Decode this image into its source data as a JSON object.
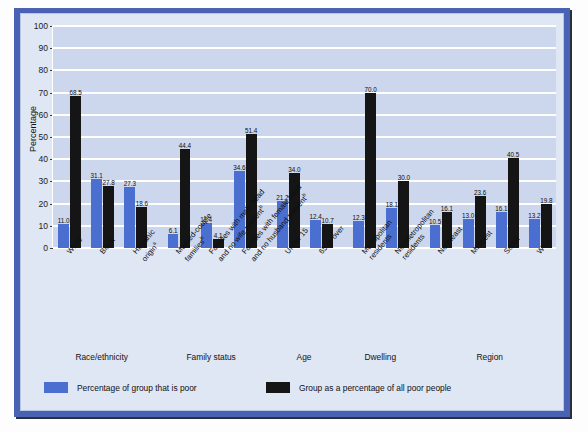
{
  "chart_data": {
    "type": "bar",
    "title": "",
    "xlabel": "",
    "ylabel": "Percentage",
    "ylim": [
      0,
      100
    ],
    "yticks": [
      0,
      10,
      20,
      30,
      40,
      50,
      60,
      70,
      80,
      90,
      100
    ],
    "grid": true,
    "legend_position": "bottom-left",
    "categories": [
      "White",
      "Black",
      "Hispanic originᵃ",
      "Married-couple familiesᵇ",
      "Families with male head and no wife presentᵇ",
      "Families with female head and no husband presentᵇ",
      "Under 15",
      "65 or over",
      "Metropolitan residents",
      "Nonmetropolitan residents",
      "Northeast",
      "Midwest",
      "South",
      "West"
    ],
    "series": [
      {
        "name": "Percentage of group that is poor",
        "color": "#4a6fd0",
        "values": [
          11.0,
          31.1,
          27.3,
          6.1,
          11.4,
          34.6,
          21.2,
          12.4,
          12.3,
          18.1,
          10.5,
          13.0,
          16.1,
          13.2
        ]
      },
      {
        "name": "Group as a percentage of all poor people",
        "color": "#151515",
        "values": [
          68.5,
          27.8,
          18.6,
          44.4,
          4.1,
          51.4,
          34.0,
          10.7,
          70.0,
          30.0,
          16.1,
          23.6,
          40.5,
          19.8
        ]
      }
    ],
    "groups": [
      {
        "label": "Race/ethnicity",
        "categories": [
          "White",
          "Black",
          "Hispanic originᵃ"
        ]
      },
      {
        "label": "Family status",
        "categories": [
          "Married-couple familiesᵇ",
          "Families with male head and no wife presentᵇ",
          "Families with female head and no husband presentᵇ"
        ]
      },
      {
        "label": "Age",
        "categories": [
          "Under 15",
          "65 or over"
        ]
      },
      {
        "label": "Dwelling",
        "categories": [
          "Metropolitan residents",
          "Nonmetropolitan residents"
        ]
      },
      {
        "label": "Region",
        "categories": [
          "Northeast",
          "Midwest",
          "South",
          "West"
        ]
      }
    ]
  },
  "axis": {
    "ylabel": "Percentage",
    "ytick_labels": [
      "100",
      "90",
      "80",
      "70",
      "60",
      "50",
      "40",
      "30",
      "20",
      "10",
      "0"
    ]
  },
  "category_labels": [
    {
      "line1": "White",
      "line2": "",
      "sup": ""
    },
    {
      "line1": "Black",
      "line2": "",
      "sup": ""
    },
    {
      "line1": "Hispanic",
      "line2": "origin",
      "sup": "a"
    },
    {
      "line1": "Married-couple",
      "line2": "families",
      "sup": "b"
    },
    {
      "line1": "Families with male head",
      "line2": "and no wife present",
      "sup": "b"
    },
    {
      "line1": "Families with female head",
      "line2": "and no husband present",
      "sup": "b"
    },
    {
      "line1": "Under 15",
      "line2": "",
      "sup": ""
    },
    {
      "line1": "65 or over",
      "line2": "",
      "sup": ""
    },
    {
      "line1": "Metropolitan",
      "line2": "residents",
      "sup": ""
    },
    {
      "line1": "Nonmetropolitan",
      "line2": "residents",
      "sup": ""
    },
    {
      "line1": "Northeast",
      "line2": "",
      "sup": ""
    },
    {
      "line1": "Midwest",
      "line2": "",
      "sup": ""
    },
    {
      "line1": "South",
      "line2": "",
      "sup": ""
    },
    {
      "line1": "West",
      "line2": "",
      "sup": ""
    }
  ],
  "group_labels": [
    "Race/ethnicity",
    "Family status",
    "Age",
    "Dwelling",
    "Region"
  ],
  "legend": {
    "items": [
      {
        "label": "Percentage of group that is poor",
        "color": "#4a6fd0"
      },
      {
        "label": "Group as a percentage of all poor people",
        "color": "#151515"
      }
    ]
  },
  "value_labels": {
    "blue": [
      "11.0",
      "31.1",
      "27.3",
      "6.1",
      "11.4",
      "34.6",
      "21.2",
      "12.4",
      "12.3",
      "18.1",
      "10.5",
      "13.0",
      "16.1",
      "13.2"
    ],
    "black": [
      "68.5",
      "27.8",
      "18.6",
      "44.4",
      "4.1",
      "51.4",
      "34.0",
      "10.7",
      "70.0",
      "30.0",
      "16.1",
      "23.6",
      "40.5",
      "19.8"
    ]
  },
  "colors": {
    "panel_frame": "#4a62b4",
    "panel_background": "#dfe6f4",
    "plot_background": "#ccd6ec",
    "gridline": "#ffffff",
    "series_blue": "#4a6fd0",
    "series_black": "#151515"
  }
}
